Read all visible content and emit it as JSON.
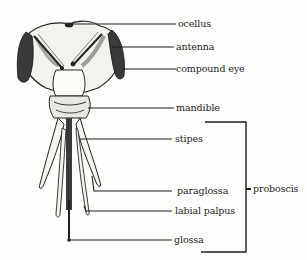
{
  "diagram": {
    "labels": [
      {
        "id": "ocellus",
        "text": "ocellus"
      },
      {
        "id": "antenna",
        "text": "antenna"
      },
      {
        "id": "compound-eye",
        "text": "compound eye"
      },
      {
        "id": "mandible",
        "text": "mandible"
      },
      {
        "id": "stipes",
        "text": "stipes"
      },
      {
        "id": "paraglossa",
        "text": "paraglossa"
      },
      {
        "id": "labial-palpus",
        "text": "labial palpus"
      },
      {
        "id": "glossa",
        "text": "glossa"
      }
    ],
    "group_bracket": {
      "label": "proboscis",
      "covers": [
        "stipes",
        "paraglossa",
        "labial palpus",
        "glossa"
      ]
    },
    "colors": {
      "ink": "#1e1e1e",
      "background": "#fdfdfb"
    }
  }
}
